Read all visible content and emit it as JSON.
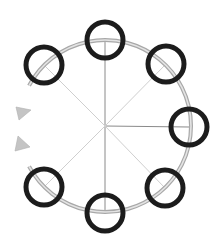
{
  "diagram": {
    "type": "radial-cycle",
    "width": 224,
    "height": 252,
    "center": {
      "x": 105,
      "y": 126
    },
    "orbit": {
      "radius": 86,
      "gap_start_deg": 152,
      "gap_end_deg": 208,
      "outer_color": "#a8a8a8",
      "inner_color": "#e4e4e4"
    },
    "arrows": [
      {
        "name": "arrowhead-upper",
        "points": "16,107 31,110 19,120",
        "color": "#c4c4c4"
      },
      {
        "name": "arrowhead-lower",
        "points": "18,136 30,147 15,151",
        "color": "#c4c4c4"
      }
    ],
    "spokes": [
      {
        "name": "spoke-top",
        "x2": 105,
        "y2": 40,
        "color": "#8a8a8a"
      },
      {
        "name": "spoke-right",
        "x2": 189,
        "y2": 127,
        "color": "#8a8a8a"
      },
      {
        "name": "spoke-bottom",
        "x2": 105,
        "y2": 213,
        "color": "#8a8a8a"
      },
      {
        "name": "spoke-top-right",
        "x2": 166,
        "y2": 64,
        "color": "#cfcfcf"
      },
      {
        "name": "spoke-bottom-right",
        "x2": 165,
        "y2": 188,
        "color": "#cfcfcf"
      },
      {
        "name": "spoke-top-left",
        "x2": 44,
        "y2": 65,
        "color": "#cfcfcf"
      },
      {
        "name": "spoke-bottom-left",
        "x2": 44,
        "y2": 187,
        "color": "#cfcfcf"
      }
    ],
    "nodes": [
      {
        "name": "node-top",
        "cx": 105,
        "cy": 40
      },
      {
        "name": "node-top-right",
        "cx": 166,
        "cy": 64
      },
      {
        "name": "node-right",
        "cx": 189,
        "cy": 127
      },
      {
        "name": "node-bottom-right",
        "cx": 165,
        "cy": 188
      },
      {
        "name": "node-bottom",
        "cx": 105,
        "cy": 213
      },
      {
        "name": "node-bottom-left",
        "cx": 44,
        "cy": 187
      },
      {
        "name": "node-top-left",
        "cx": 44,
        "cy": 65
      }
    ],
    "node_style": {
      "radius": 18,
      "stroke": "#1c1c1c",
      "stroke_width": 5,
      "fill": "none"
    }
  }
}
